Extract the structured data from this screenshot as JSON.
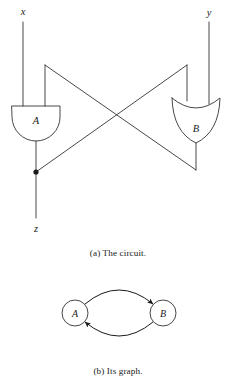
{
  "figure": {
    "subfigures": [
      {
        "id": "circuit",
        "caption": "(a) The circuit.",
        "caption_marker": "(a)",
        "caption_text": "The circuit."
      },
      {
        "id": "graph",
        "caption": "(b) Its graph.",
        "caption_marker": "(b)",
        "caption_text": "Its graph."
      }
    ]
  },
  "circuit": {
    "inputs": [
      {
        "name": "x",
        "label": "x"
      },
      {
        "name": "y",
        "label": "y"
      }
    ],
    "outputs": [
      {
        "name": "z",
        "label": "z"
      }
    ],
    "gates": [
      {
        "name": "A",
        "label": "A",
        "type": "and-gate"
      },
      {
        "name": "B",
        "label": "B",
        "type": "or-gate"
      }
    ],
    "junctions": [
      {
        "name": "z-tap",
        "on": "A-output"
      }
    ]
  },
  "graph": {
    "nodes": [
      {
        "id": "A",
        "label": "A"
      },
      {
        "id": "B",
        "label": "B"
      }
    ],
    "edges": [
      {
        "from": "A",
        "to": "B"
      },
      {
        "from": "B",
        "to": "A"
      }
    ]
  },
  "style": {
    "stroke": "#333333",
    "text": "#1a1a1a",
    "background": "#ffffff"
  }
}
